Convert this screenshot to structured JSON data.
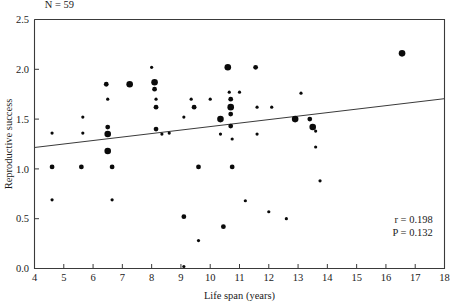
{
  "chart_data": {
    "type": "scatter",
    "title": "",
    "xlabel": "Life span (years)",
    "ylabel": "Reproductive success",
    "xlim": [
      4,
      18
    ],
    "ylim": [
      0.0,
      2.5
    ],
    "xticks": [
      4,
      5,
      6,
      7,
      8,
      9,
      10,
      11,
      12,
      13,
      14,
      15,
      16,
      17,
      18
    ],
    "yticks": [
      0.0,
      0.5,
      1.0,
      1.5,
      2.0,
      2.5
    ],
    "xtick_labels": [
      "4",
      "5",
      "6",
      "7",
      "8",
      "9",
      "10",
      "11",
      "12",
      "13",
      "14",
      "15",
      "16",
      "17",
      "18"
    ],
    "ytick_labels": [
      "0.0",
      "0.5",
      "1.0",
      "1.5",
      "2.0",
      "2.5"
    ],
    "grid": false,
    "legend": "none",
    "annotations": [
      {
        "name": "sample-size",
        "text": "N = 59",
        "x": 4.35,
        "y": 2.62,
        "align": "start"
      },
      {
        "name": "correlation-coefficient",
        "text": "r = 0.198",
        "x": 17.6,
        "y": 0.46,
        "align": "end"
      },
      {
        "name": "p-value",
        "text": "P = 0.132",
        "x": 17.6,
        "y": 0.33,
        "align": "end"
      }
    ],
    "trendline": {
      "name": "regression-line",
      "x0": 4.0,
      "y0": 1.215,
      "x1": 18.0,
      "y1": 1.705
    },
    "marker_sizes": {
      "small": 1.6,
      "medium": 2.4,
      "large": 3.3
    },
    "points": [
      {
        "x": 4.6,
        "y": 1.36,
        "size": "small"
      },
      {
        "x": 4.6,
        "y": 1.02,
        "size": "medium"
      },
      {
        "x": 4.6,
        "y": 0.69,
        "size": "small"
      },
      {
        "x": 5.6,
        "y": 1.02,
        "size": "medium"
      },
      {
        "x": 5.65,
        "y": 1.52,
        "size": "small"
      },
      {
        "x": 5.65,
        "y": 1.36,
        "size": "small"
      },
      {
        "x": 6.45,
        "y": 1.85,
        "size": "medium"
      },
      {
        "x": 6.5,
        "y": 1.7,
        "size": "small"
      },
      {
        "x": 6.5,
        "y": 1.42,
        "size": "medium"
      },
      {
        "x": 6.5,
        "y": 1.35,
        "size": "large"
      },
      {
        "x": 6.5,
        "y": 1.18,
        "size": "large"
      },
      {
        "x": 6.65,
        "y": 1.02,
        "size": "medium"
      },
      {
        "x": 6.65,
        "y": 0.69,
        "size": "small"
      },
      {
        "x": 7.25,
        "y": 1.85,
        "size": "large"
      },
      {
        "x": 8.0,
        "y": 2.02,
        "size": "small"
      },
      {
        "x": 8.1,
        "y": 1.87,
        "size": "large"
      },
      {
        "x": 8.1,
        "y": 1.8,
        "size": "medium"
      },
      {
        "x": 8.15,
        "y": 1.7,
        "size": "small"
      },
      {
        "x": 8.15,
        "y": 1.62,
        "size": "medium"
      },
      {
        "x": 8.15,
        "y": 1.4,
        "size": "medium"
      },
      {
        "x": 8.35,
        "y": 1.35,
        "size": "small"
      },
      {
        "x": 8.6,
        "y": 1.36,
        "size": "small"
      },
      {
        "x": 9.1,
        "y": 1.52,
        "size": "small"
      },
      {
        "x": 9.1,
        "y": 0.52,
        "size": "medium"
      },
      {
        "x": 9.1,
        "y": 0.02,
        "size": "small"
      },
      {
        "x": 9.35,
        "y": 1.7,
        "size": "small"
      },
      {
        "x": 9.45,
        "y": 1.62,
        "size": "medium"
      },
      {
        "x": 9.6,
        "y": 1.02,
        "size": "medium"
      },
      {
        "x": 9.6,
        "y": 0.28,
        "size": "small"
      },
      {
        "x": 10.0,
        "y": 1.7,
        "size": "small"
      },
      {
        "x": 10.35,
        "y": 1.5,
        "size": "large"
      },
      {
        "x": 10.35,
        "y": 1.35,
        "size": "small"
      },
      {
        "x": 10.45,
        "y": 0.42,
        "size": "medium"
      },
      {
        "x": 10.6,
        "y": 2.02,
        "size": "large"
      },
      {
        "x": 10.65,
        "y": 1.77,
        "size": "small"
      },
      {
        "x": 10.7,
        "y": 1.7,
        "size": "medium"
      },
      {
        "x": 10.7,
        "y": 1.62,
        "size": "large"
      },
      {
        "x": 10.7,
        "y": 1.55,
        "size": "medium"
      },
      {
        "x": 10.7,
        "y": 1.43,
        "size": "medium"
      },
      {
        "x": 10.75,
        "y": 1.3,
        "size": "small"
      },
      {
        "x": 10.75,
        "y": 1.02,
        "size": "medium"
      },
      {
        "x": 11.0,
        "y": 1.77,
        "size": "small"
      },
      {
        "x": 11.2,
        "y": 0.68,
        "size": "small"
      },
      {
        "x": 11.55,
        "y": 2.02,
        "size": "medium"
      },
      {
        "x": 11.6,
        "y": 1.62,
        "size": "small"
      },
      {
        "x": 11.6,
        "y": 1.35,
        "size": "small"
      },
      {
        "x": 12.0,
        "y": 0.57,
        "size": "small"
      },
      {
        "x": 12.1,
        "y": 1.62,
        "size": "small"
      },
      {
        "x": 12.6,
        "y": 0.5,
        "size": "small"
      },
      {
        "x": 12.9,
        "y": 1.5,
        "size": "large"
      },
      {
        "x": 13.1,
        "y": 1.76,
        "size": "small"
      },
      {
        "x": 13.4,
        "y": 1.5,
        "size": "medium"
      },
      {
        "x": 13.5,
        "y": 1.42,
        "size": "large"
      },
      {
        "x": 13.6,
        "y": 1.38,
        "size": "small"
      },
      {
        "x": 13.6,
        "y": 1.22,
        "size": "small"
      },
      {
        "x": 13.75,
        "y": 0.88,
        "size": "small"
      },
      {
        "x": 16.55,
        "y": 2.16,
        "size": "large"
      }
    ]
  },
  "axes": {
    "y_axis_title": "Reproductive success",
    "x_axis_title": "Life span (years)"
  }
}
